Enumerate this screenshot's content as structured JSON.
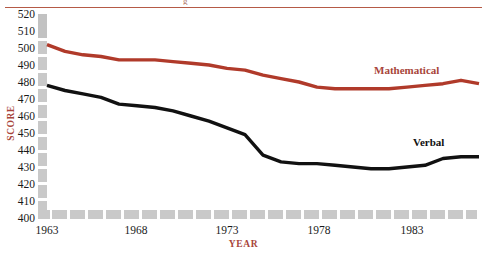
{
  "chart_data": {
    "type": "line",
    "title": "",
    "xlabel": "YEAR",
    "ylabel": "SCORE",
    "xlim": [
      1963,
      1987
    ],
    "ylim": [
      400,
      520
    ],
    "y_ticks": [
      400,
      410,
      420,
      430,
      440,
      450,
      460,
      470,
      480,
      490,
      500,
      510,
      520
    ],
    "x_ticks": [
      1963,
      1968,
      1973,
      1978,
      1983
    ],
    "x": [
      1963,
      1964,
      1965,
      1966,
      1967,
      1968,
      1969,
      1970,
      1971,
      1972,
      1973,
      1974,
      1975,
      1976,
      1977,
      1978,
      1979,
      1980,
      1981,
      1982,
      1983,
      1984,
      1985,
      1986,
      1987
    ],
    "grid": false,
    "legend_position": "inline-annotations",
    "series": [
      {
        "name": "Mathematical",
        "color": "#b03a2a",
        "values": [
          502,
          498,
          496,
          495,
          493,
          493,
          493,
          492,
          491,
          490,
          488,
          487,
          484,
          482,
          480,
          477,
          476,
          476,
          476,
          476,
          477,
          478,
          479,
          481,
          479
        ]
      },
      {
        "name": "Verbal",
        "color": "#111111",
        "values": [
          478,
          475,
          473,
          471,
          467,
          466,
          465,
          463,
          460,
          457,
          453,
          449,
          437,
          433,
          432,
          432,
          431,
          430,
          429,
          429,
          430,
          431,
          435,
          436,
          436
        ]
      }
    ],
    "annotations": [
      {
        "text": "Mathematical",
        "x": 1983,
        "y": 490,
        "color": "#a8453a"
      },
      {
        "text": "Verbal",
        "x": 1983,
        "y": 443,
        "color": "#111111"
      }
    ]
  },
  "axes": {
    "y_tick_labels": [
      "520",
      "510",
      "500",
      "490",
      "480",
      "470",
      "460",
      "450",
      "440",
      "430",
      "420",
      "410",
      "400"
    ],
    "x_tick_labels": [
      "1963",
      "1968",
      "1973",
      "1978",
      "1983"
    ],
    "y_title": "SCORE",
    "x_title": "YEAR"
  },
  "labels": {
    "mathematical": "Mathematical",
    "verbal": "Verbal"
  },
  "decor": {
    "top_rule_color": "#b55a46",
    "axis_color": "#c9c9c9",
    "clipped_glyph": "g"
  }
}
